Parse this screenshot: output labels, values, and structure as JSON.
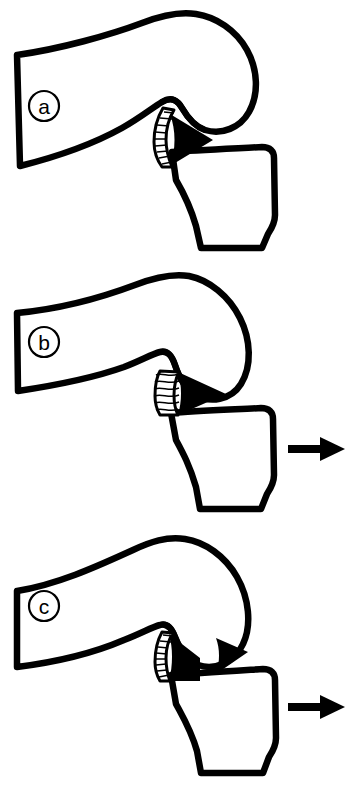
{
  "figure": {
    "background_color": "#ffffff",
    "ink_color": "#000000",
    "width_px": 351,
    "height_px": 798,
    "panel_count": 3
  },
  "panels": [
    {
      "id": "panel-a",
      "label": "a",
      "label_style": "circled-letter",
      "stage_name": "normal-labrum",
      "description": "Intact acetabular labrum seated against femoral head",
      "has_traction_arrow": false,
      "labrum_state": "intact",
      "pointer_arrow_count": 1,
      "top_px": 0,
      "height_px": 268
    },
    {
      "id": "panel-b",
      "label": "b",
      "label_style": "circled-letter",
      "stage_name": "compressed-labrum",
      "description": "Labrum compressed and flattened under traction",
      "has_traction_arrow": true,
      "labrum_state": "compressed",
      "pointer_arrow_count": 1,
      "top_px": 268,
      "height_px": 266
    },
    {
      "id": "panel-c",
      "label": "c",
      "label_style": "circled-letter",
      "stage_name": "detached-labrum",
      "description": "Labrum detached from acetabular rim with separation gap",
      "has_traction_arrow": true,
      "labrum_state": "detached",
      "pointer_arrow_count": 2,
      "top_px": 534,
      "height_px": 264
    }
  ],
  "anatomy": {
    "iliac_wing": "iliac-wing-blade",
    "femoral_head": "femoral-head-bulb",
    "femoral_neck": "femoral-neck",
    "labrum": "acetabular-labrum",
    "acetabulum": "acetabular-socket-bone"
  },
  "arrows": {
    "traction_direction": "right",
    "pointer_fill": "#000000",
    "traction_fill": "#000000"
  }
}
